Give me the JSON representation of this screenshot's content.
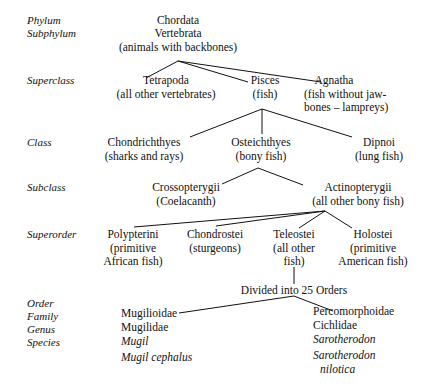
{
  "diagram": {
    "type": "tree",
    "line_color": "#111111",
    "background": "#ffffff"
  },
  "rank_labels": [
    {
      "name": "phylum",
      "text": "Phylum",
      "x": 27,
      "y": 14
    },
    {
      "name": "subphylum",
      "text": "Subphylum",
      "x": 27,
      "y": 27
    },
    {
      "name": "superclass",
      "text": "Superclass",
      "x": 27,
      "y": 74
    },
    {
      "name": "class",
      "text": "Class",
      "x": 27,
      "y": 136
    },
    {
      "name": "subclass",
      "text": "Subclass",
      "x": 27,
      "y": 181
    },
    {
      "name": "superorder",
      "text": "Superorder",
      "x": 27,
      "y": 228
    },
    {
      "name": "order",
      "text": "Order",
      "x": 27,
      "y": 297
    },
    {
      "name": "family",
      "text": "Family",
      "x": 27,
      "y": 310
    },
    {
      "name": "genus",
      "text": "Genus",
      "x": 27,
      "y": 323
    },
    {
      "name": "species",
      "text": "Species",
      "x": 27,
      "y": 336
    }
  ],
  "nodes": {
    "chordata": {
      "name": "Chordata"
    },
    "vertebrata": {
      "name": "Vertebrata"
    },
    "vertebrata_note": {
      "name": "(animals with backbones)"
    },
    "tetrapoda": {
      "name": "Tetrapoda",
      "note": "(all other vertebrates)"
    },
    "pisces": {
      "name": "Pisces",
      "note": "(fish)"
    },
    "agnatha": {
      "name": "Agnatha",
      "note1": "(fish without jaw-",
      "note2": "bones – lampreys)"
    },
    "chondrichthyes": {
      "name": "Chondrichthyes",
      "note": "(sharks and rays)"
    },
    "osteichthyes": {
      "name": "Osteichthyes",
      "note": "(bony fish)"
    },
    "dipnoi": {
      "name": "Dipnoi",
      "note": "(lung fish)"
    },
    "crossopterygii": {
      "name": "Crossopterygii",
      "note": "(Coelacanth)"
    },
    "actinopterygii": {
      "name": "Actinopterygii",
      "note": "(all other bony fish)"
    },
    "polypterini": {
      "name": "Polypterini",
      "note1": "(primitive",
      "note2": "African fish)"
    },
    "chondrostei": {
      "name": "Chondrostei",
      "note": "(sturgeons)"
    },
    "teleostei": {
      "name": "Teleostei",
      "note1": "(all other",
      "note2": "fish)"
    },
    "holostei": {
      "name": "Holostei",
      "note1": "(primitive",
      "note2": "American fish)"
    },
    "divided": {
      "name": "Divided into 25 Orders"
    },
    "mugil_order": {
      "name": "Mugilioidae"
    },
    "mugil_family": {
      "name": "Mugilidae"
    },
    "mugil_genus": {
      "name": "Mugil"
    },
    "mugil_species": {
      "name": "Mugil cephalus"
    },
    "perco_order": {
      "name": "Percomorphoidae"
    },
    "perco_family": {
      "name": "Cichlidae"
    },
    "perco_genus": {
      "name": "Sarotherodon"
    },
    "perco_species_1": {
      "name": "Sarotherodon"
    },
    "perco_species_2": {
      "name": "nilotica"
    }
  },
  "edges": [
    {
      "from": "vertebrata",
      "to": "tetrapoda",
      "path": "M178,61 L146,78"
    },
    {
      "from": "vertebrata",
      "to": "pisces",
      "path": "M178,61 L248,82"
    },
    {
      "from": "vertebrata",
      "to": "agnatha",
      "path": "M178,61 L321,82"
    },
    {
      "from": "pisces",
      "to": "chondrichthyes",
      "path": "M262,109 L190,137"
    },
    {
      "from": "pisces",
      "to": "osteichthyes",
      "path": "M262,109 L262,134"
    },
    {
      "from": "pisces",
      "to": "dipnoi",
      "path": "M262,109 L352,137"
    },
    {
      "from": "osteichthyes",
      "to": "crossopterygii",
      "path": "M258,168 L222,184"
    },
    {
      "from": "osteichthyes",
      "to": "actinopterygii",
      "path": "M258,168 L303,185"
    },
    {
      "from": "actinopterygii",
      "to": "polypterini",
      "path": "M325,211 L134,227"
    },
    {
      "from": "actinopterygii",
      "to": "chondrostei",
      "path": "M325,211 L216,226"
    },
    {
      "from": "actinopterygii",
      "to": "teleostei",
      "path": "M325,211 L299,228"
    },
    {
      "from": "actinopterygii",
      "to": "holostei",
      "path": "M325,211 L352,228"
    },
    {
      "from": "teleostei",
      "to": "divided",
      "path": "M294,267 L294,284"
    },
    {
      "from": "divided",
      "to": "mugil_order",
      "path": "M294,296 L179,313"
    },
    {
      "from": "divided",
      "to": "perco_order",
      "path": "M294,296 L333,311"
    }
  ]
}
